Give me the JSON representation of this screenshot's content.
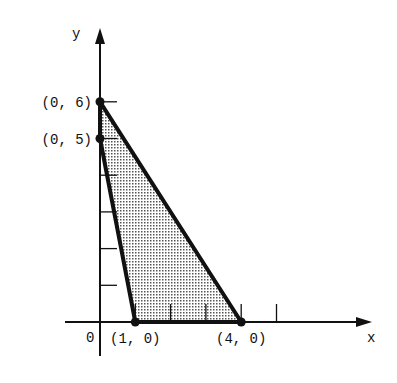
{
  "chart_data": {
    "type": "diagram",
    "title": "",
    "xlabel": "x",
    "ylabel": "y",
    "origin_label": "0",
    "x_ticks": [
      1,
      2,
      3,
      4,
      5
    ],
    "y_ticks": [
      1,
      2,
      3,
      4,
      5,
      6
    ],
    "feasible_region": [
      [
        0,
        6
      ],
      [
        4,
        0
      ],
      [
        1,
        0
      ],
      [
        0,
        5
      ]
    ],
    "points": [
      {
        "x": 0,
        "y": 6,
        "label": "(0, 6)"
      },
      {
        "x": 0,
        "y": 5,
        "label": "(0, 5)"
      },
      {
        "x": 1,
        "y": 0,
        "label": "(1, 0)"
      },
      {
        "x": 4,
        "y": 0,
        "label": "(4, 0)"
      }
    ],
    "colors": {
      "ink": "#111111",
      "fill": "#bdbdbd"
    }
  }
}
